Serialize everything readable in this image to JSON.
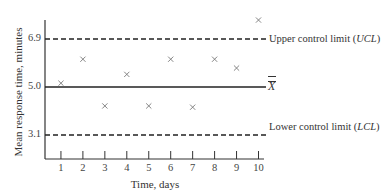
{
  "chart_data": {
    "type": "scatter",
    "title": "",
    "xlabel": "Time, days",
    "ylabel": "Mean response time, minutes",
    "x": [
      1,
      2,
      3,
      4,
      5,
      6,
      7,
      8,
      9,
      10
    ],
    "series": [
      {
        "name": "Daily mean response time",
        "marker": "x",
        "values": [
          5.15,
          6.1,
          4.25,
          5.5,
          4.25,
          6.1,
          4.2,
          6.1,
          5.75,
          7.65
        ]
      }
    ],
    "reference_lines": [
      {
        "name": "Upper control limit (UCL)",
        "y": 6.9,
        "style": "dashed"
      },
      {
        "name": "X double bar (center line)",
        "y": 5.0,
        "style": "solid"
      },
      {
        "name": "Lower control limit (LCL)",
        "y": 3.1,
        "style": "dashed"
      }
    ],
    "yticks": [
      "6.9",
      "5.0",
      "3.1"
    ],
    "xticks": [
      "1",
      "2",
      "3",
      "4",
      "5",
      "6",
      "7",
      "8",
      "9",
      "10"
    ],
    "xlim": [
      0.2,
      10.3
    ],
    "ylim": [
      1.4,
      7.95
    ],
    "grid": false,
    "legend_position": "right, inline labels"
  },
  "labels": {
    "ucl_text": "Upper control limit (",
    "ucl_abbr": "UCL",
    "lcl_text": "Lower control limit (",
    "lcl_abbr": "LCL",
    "close_paren": ")",
    "center_symbol": "X"
  },
  "colors": {
    "axis": "#333333",
    "marker": "#777777",
    "line": "#222222"
  }
}
